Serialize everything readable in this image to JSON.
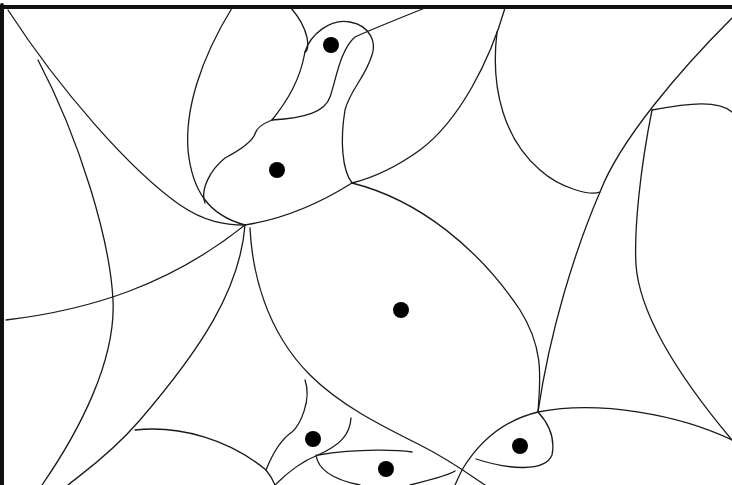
{
  "diagram": {
    "type": "curved-partition-with-sites",
    "colors": {
      "background": "#ffffff",
      "line": "#1a1a1a",
      "site": "#000000",
      "frame": "#111111"
    },
    "sites": [
      {
        "id": "s1",
        "x": 331,
        "y": 45
      },
      {
        "id": "s2",
        "x": 277,
        "y": 170
      },
      {
        "id": "s3",
        "x": 401,
        "y": 310
      },
      {
        "id": "s4",
        "x": 313,
        "y": 439
      },
      {
        "id": "s5",
        "x": 520,
        "y": 446
      },
      {
        "id": "s6",
        "x": 386,
        "y": 469
      }
    ],
    "site_radius": 8
  }
}
